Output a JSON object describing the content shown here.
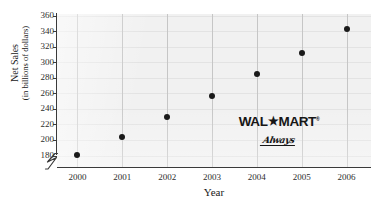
{
  "chart_data": {
    "type": "scatter",
    "title": "",
    "xlabel": "Year",
    "ylabel": "Net Sales (in billions of dollars)",
    "ylabel_main": "Net Sales",
    "ylabel_sub": "(in billions of dollars)",
    "categories": [
      "2000",
      "2001",
      "2002",
      "2003",
      "2004",
      "2005",
      "2006"
    ],
    "x": [
      2000,
      2001,
      2002,
      2003,
      2004,
      2005,
      2006
    ],
    "values": [
      181,
      204,
      230,
      256,
      285,
      312,
      343
    ],
    "series": [
      {
        "name": "Net Sales",
        "values": [
          181,
          204,
          230,
          256,
          285,
          312,
          343
        ]
      }
    ],
    "ytick_labels": [
      "360",
      "340",
      "320",
      "300",
      "280",
      "260",
      "240",
      "220",
      "200",
      "180"
    ],
    "yticks": [
      360,
      340,
      320,
      300,
      280,
      260,
      240,
      220,
      200,
      180
    ],
    "ylim": [
      170,
      360
    ],
    "xlim": [
      1999.5,
      2006.5
    ],
    "grid": true,
    "legend": "none",
    "axis_break": true,
    "marker_color": "#1a1a1a",
    "plot_background": "#f1f1f1",
    "axis_color": "#3a3a3a",
    "gridline_color": "#c6c6c6"
  },
  "watermark": {
    "name": "wal-mart-logo",
    "wordmark_left": "WAL",
    "wordmark_star": "★",
    "wordmark_right": "MART",
    "trademark": "®",
    "slogan": "Always"
  },
  "top_crop": {
    "text": "\u0001"
  }
}
